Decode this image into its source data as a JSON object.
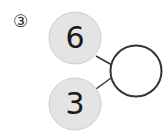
{
  "problem": {
    "label": "③",
    "top_value": "6",
    "bottom_value": "3",
    "answer_value": ""
  },
  "colors": {
    "filled_circle": "#e4e4e4",
    "filled_circle_border": "#cccccc",
    "stroke": "#333333",
    "text": "#1a1a1a"
  }
}
